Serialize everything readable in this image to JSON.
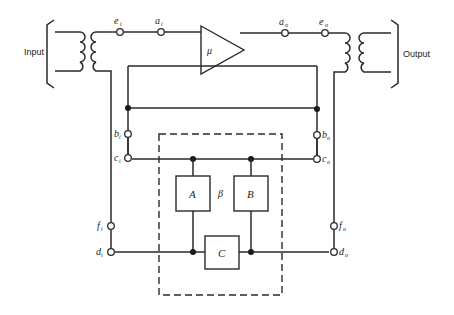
{
  "diagram": {
    "input_label": "Input",
    "output_label": "Output",
    "amplifier_label": "μ",
    "beta_label": "β",
    "blocks": {
      "A": "A",
      "B": "B",
      "C": "C"
    },
    "terminals": {
      "e_i": {
        "main": "e",
        "sub": "i"
      },
      "a_i": {
        "main": "a",
        "sub": "i"
      },
      "a_o": {
        "main": "a",
        "sub": "o"
      },
      "e_o": {
        "main": "e",
        "sub": "o"
      },
      "b_i": {
        "main": "b",
        "sub": "i"
      },
      "c_i": {
        "main": "c",
        "sub": "i"
      },
      "b_o": {
        "main": "b",
        "sub": "o"
      },
      "c_o": {
        "main": "c",
        "sub": "o"
      },
      "f_i": {
        "main": "f",
        "sub": "i"
      },
      "d_i": {
        "main": "d",
        "sub": "i"
      },
      "f_o": {
        "main": "f",
        "sub": "o"
      },
      "d_o": {
        "main": "d",
        "sub": "o"
      }
    },
    "colors": {
      "line": "#2a2a2a",
      "background": "#ffffff"
    }
  }
}
